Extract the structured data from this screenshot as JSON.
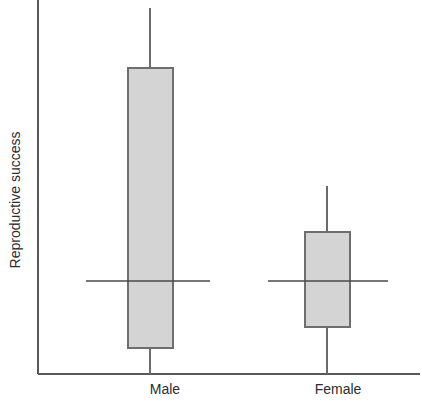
{
  "chart_data": {
    "type": "boxplot",
    "title": "",
    "xlabel": "",
    "ylabel": "Reproductive success",
    "categories": [
      "Male",
      "Female"
    ],
    "grid": false,
    "legend": false,
    "axis": {
      "y_ticks": [],
      "x_ticks": [
        "Male",
        "Female"
      ],
      "y_axis_visible": true,
      "x_axis_visible": true,
      "ylim_note": "unlabeled relative scale"
    },
    "colors": {
      "box_fill": "#d4d4d4",
      "box_border": "#6e6e70",
      "whisker": "#6b6b6d",
      "median": "#4a4a4c",
      "axis": "#58585a",
      "text": "#2d2d2f",
      "background": "#ffffff"
    },
    "boxes": [
      {
        "name": "Male",
        "whisker_high": 0.978,
        "box_top": 0.818,
        "median": 0.248,
        "box_bottom": 0.07,
        "whisker_low": 0.0,
        "px": {
          "x_left": 128,
          "x_right": 173,
          "x_center": 150,
          "y_whisker_high": 8,
          "y_box_top": 68,
          "y_median": 281,
          "y_box_bottom": 348,
          "y_whisker_low": 374,
          "median_x_left": 86,
          "median_x_right": 210
        }
      },
      {
        "name": "Female",
        "whisker_high": 0.503,
        "box_top": 0.38,
        "median": 0.248,
        "box_bottom": 0.128,
        "whisker_low": 0.0,
        "px": {
          "x_left": 305,
          "x_right": 350,
          "x_center": 327,
          "y_whisker_high": 186,
          "y_box_top": 232,
          "y_median": 281,
          "y_box_bottom": 327,
          "y_whisker_low": 374,
          "median_x_left": 268,
          "median_x_right": 388
        }
      }
    ],
    "geometry": {
      "y_axis_x": 38,
      "y_axis_top": 0,
      "x_axis_y": 374,
      "x_axis_right": 420,
      "label_y": 394,
      "ylabel_x": 20,
      "ylabel_y": 200
    }
  }
}
